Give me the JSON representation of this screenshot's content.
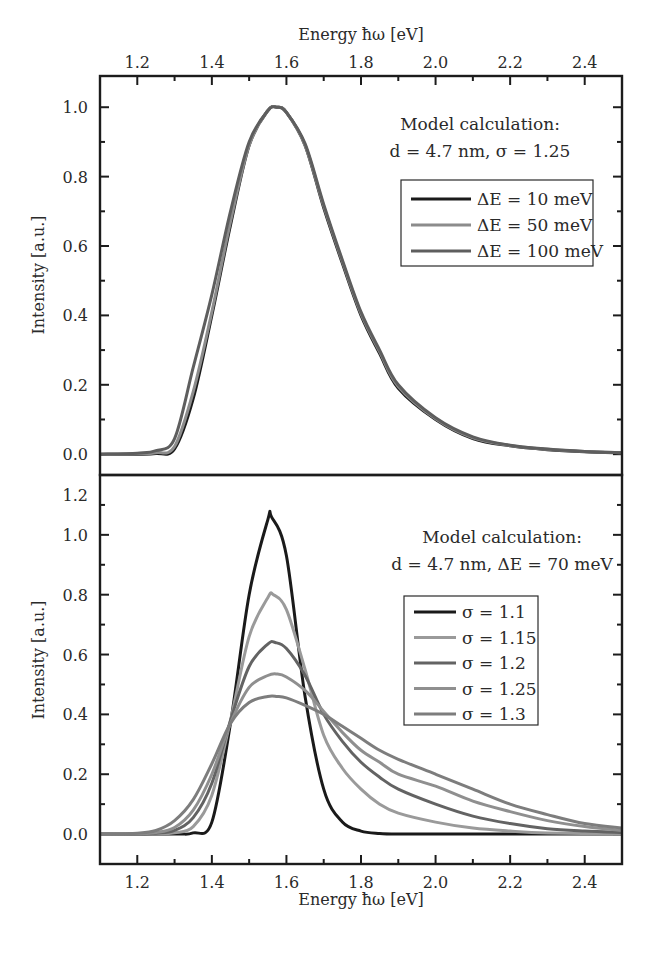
{
  "chart_data": [
    {
      "type": "line",
      "panel": "top",
      "title": "",
      "xlabel": "Energy ħω [eV]",
      "xlabel_position": "top",
      "ylabel": "Intensity [a.u.]",
      "xlim": [
        1.1,
        2.5
      ],
      "ylim": [
        -0.06,
        1.09
      ],
      "x_ticks": [
        1.2,
        1.4,
        1.6,
        1.8,
        2.0,
        2.2,
        2.4
      ],
      "x_tick_labels": [
        "1.2",
        "1.4",
        "1.6",
        "1.8",
        "2.0",
        "2.2",
        "2.4"
      ],
      "y_ticks": [
        0.0,
        0.2,
        0.4,
        0.6,
        0.8,
        1.0
      ],
      "y_tick_labels": [
        "0.0",
        "0.2",
        "0.4",
        "0.6",
        "0.8",
        "1.0"
      ],
      "grid": false,
      "annotation": [
        "Model calculation:",
        "d = 4.7 nm, σ = 1.25"
      ],
      "legend_position": "right",
      "series": [
        {
          "name": "ΔE = 10 meV",
          "color": "#1a1a1a",
          "x": [
            1.1,
            1.2,
            1.25,
            1.3,
            1.35,
            1.4,
            1.45,
            1.5,
            1.55,
            1.575,
            1.6,
            1.65,
            1.7,
            1.75,
            1.8,
            1.85,
            1.9,
            2.0,
            2.1,
            2.2,
            2.3,
            2.4,
            2.5
          ],
          "y": [
            0,
            0,
            0.002,
            0.015,
            0.16,
            0.4,
            0.66,
            0.89,
            0.99,
            1.0,
            0.985,
            0.89,
            0.71,
            0.55,
            0.4,
            0.29,
            0.19,
            0.1,
            0.045,
            0.024,
            0.013,
            0.007,
            0.004
          ]
        },
        {
          "name": "ΔE = 50 meV",
          "color": "#8c8c8c",
          "x": [
            1.1,
            1.2,
            1.25,
            1.3,
            1.35,
            1.4,
            1.45,
            1.5,
            1.55,
            1.575,
            1.6,
            1.65,
            1.7,
            1.75,
            1.8,
            1.85,
            1.9,
            2.0,
            2.1,
            2.2,
            2.3,
            2.4,
            2.5
          ],
          "y": [
            0,
            0.001,
            0.004,
            0.022,
            0.18,
            0.41,
            0.67,
            0.89,
            0.99,
            1.0,
            0.985,
            0.89,
            0.715,
            0.555,
            0.405,
            0.295,
            0.195,
            0.102,
            0.047,
            0.025,
            0.014,
            0.008,
            0.004
          ]
        },
        {
          "name": "ΔE = 100 meV",
          "color": "#5e5e5e",
          "x": [
            1.1,
            1.2,
            1.25,
            1.3,
            1.35,
            1.4,
            1.45,
            1.5,
            1.55,
            1.575,
            1.6,
            1.65,
            1.7,
            1.75,
            1.8,
            1.85,
            1.9,
            2.0,
            2.1,
            2.2,
            2.3,
            2.4,
            2.5
          ],
          "y": [
            0,
            0.003,
            0.01,
            0.045,
            0.25,
            0.46,
            0.7,
            0.9,
            0.99,
            1.0,
            0.985,
            0.895,
            0.72,
            0.56,
            0.41,
            0.3,
            0.2,
            0.105,
            0.05,
            0.026,
            0.015,
            0.008,
            0.004
          ]
        }
      ]
    },
    {
      "type": "line",
      "panel": "bottom",
      "title": "",
      "xlabel": "Energy ħω [eV]",
      "xlabel_position": "bottom",
      "ylabel": "Intensity [a.u.]",
      "xlim": [
        1.1,
        2.5
      ],
      "ylim": [
        -0.1,
        1.2
      ],
      "x_ticks": [
        1.2,
        1.4,
        1.6,
        1.8,
        2.0,
        2.2,
        2.4
      ],
      "x_tick_labels": [
        "1.2",
        "1.4",
        "1.6",
        "1.8",
        "2.0",
        "2.2",
        "2.4"
      ],
      "y_ticks": [
        0.0,
        0.2,
        0.4,
        0.6,
        0.8,
        1.0,
        1.2
      ],
      "y_tick_labels": [
        "0.0",
        "0.2",
        "0.4",
        "0.6",
        "0.8",
        "1.0",
        "1.2"
      ],
      "grid": false,
      "annotation": [
        "Model calculation:",
        "d = 4.7 nm, ΔE = 70 meV"
      ],
      "legend_position": "right",
      "series": [
        {
          "name": "σ = 1.1",
          "color": "#1a1a1a",
          "x": [
            1.1,
            1.3,
            1.35,
            1.4,
            1.45,
            1.5,
            1.55,
            1.56,
            1.6,
            1.65,
            1.7,
            1.75,
            1.8,
            1.85,
            1.9,
            2.0,
            2.2,
            2.5
          ],
          "y": [
            0,
            0,
            0.004,
            0.04,
            0.37,
            0.8,
            1.05,
            1.06,
            0.93,
            0.46,
            0.15,
            0.04,
            0.01,
            0.002,
            0,
            0,
            0,
            0
          ]
        },
        {
          "name": "σ = 1.15",
          "color": "#9a9a9a",
          "x": [
            1.1,
            1.25,
            1.3,
            1.35,
            1.4,
            1.45,
            1.5,
            1.55,
            1.565,
            1.6,
            1.65,
            1.7,
            1.75,
            1.8,
            1.85,
            1.9,
            2.0,
            2.1,
            2.2,
            2.3,
            2.5
          ],
          "y": [
            0,
            0,
            0.004,
            0.025,
            0.13,
            0.38,
            0.66,
            0.79,
            0.8,
            0.75,
            0.55,
            0.33,
            0.22,
            0.15,
            0.1,
            0.07,
            0.04,
            0.02,
            0.01,
            0.004,
            0.001
          ]
        },
        {
          "name": "σ = 1.2",
          "color": "#636363",
          "x": [
            1.1,
            1.2,
            1.25,
            1.3,
            1.35,
            1.4,
            1.45,
            1.5,
            1.55,
            1.57,
            1.6,
            1.65,
            1.7,
            1.75,
            1.8,
            1.85,
            1.9,
            2.0,
            2.1,
            2.2,
            2.3,
            2.4,
            2.5
          ],
          "y": [
            0,
            0,
            0.003,
            0.012,
            0.055,
            0.17,
            0.38,
            0.56,
            0.635,
            0.64,
            0.62,
            0.53,
            0.4,
            0.31,
            0.24,
            0.19,
            0.15,
            0.1,
            0.06,
            0.035,
            0.018,
            0.01,
            0.005
          ]
        },
        {
          "name": "σ = 1.25",
          "color": "#8f8f8f",
          "x": [
            1.1,
            1.2,
            1.25,
            1.3,
            1.35,
            1.4,
            1.45,
            1.5,
            1.55,
            1.575,
            1.6,
            1.65,
            1.7,
            1.75,
            1.8,
            1.85,
            1.9,
            2.0,
            2.1,
            2.2,
            2.3,
            2.4,
            2.5
          ],
          "y": [
            0,
            0.001,
            0.005,
            0.022,
            0.08,
            0.2,
            0.37,
            0.49,
            0.53,
            0.535,
            0.525,
            0.48,
            0.41,
            0.34,
            0.28,
            0.24,
            0.2,
            0.16,
            0.11,
            0.075,
            0.045,
            0.025,
            0.012
          ]
        },
        {
          "name": "σ = 1.3",
          "color": "#7d7d7d",
          "x": [
            1.1,
            1.2,
            1.25,
            1.3,
            1.35,
            1.4,
            1.45,
            1.5,
            1.55,
            1.575,
            1.6,
            1.65,
            1.7,
            1.75,
            1.8,
            1.85,
            1.9,
            2.0,
            2.1,
            2.2,
            2.3,
            2.4,
            2.5
          ],
          "y": [
            0,
            0.003,
            0.012,
            0.045,
            0.115,
            0.235,
            0.37,
            0.44,
            0.46,
            0.46,
            0.455,
            0.43,
            0.4,
            0.36,
            0.32,
            0.28,
            0.25,
            0.2,
            0.15,
            0.1,
            0.065,
            0.035,
            0.02
          ]
        }
      ]
    }
  ]
}
